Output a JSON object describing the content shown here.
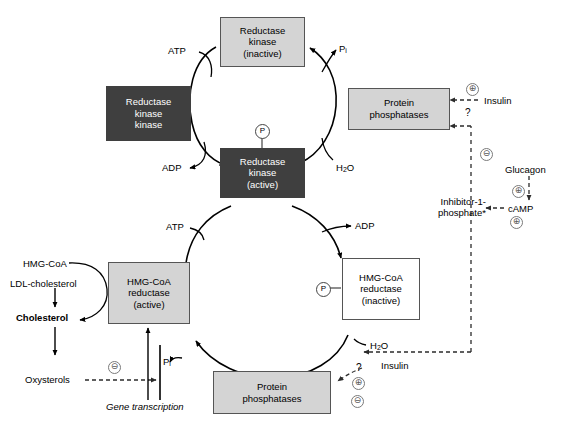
{
  "diagram": {
    "colors": {
      "box_light": "#d4d4d4",
      "box_dark": "#3f3f3f",
      "stroke": "#000000",
      "dashed": "#555555",
      "sign_circle": "#7a7a7a"
    }
  },
  "boxes": {
    "reductase_kinase_inactive": {
      "l1": "Reductase",
      "l2": "kinase",
      "l3": "(inactive)",
      "style": "light"
    },
    "reductase_kinase_kinase": {
      "l1": "Reductase",
      "l2": "kinase",
      "l3": "kinase",
      "style": "dark"
    },
    "reductase_kinase_active": {
      "l1": "Reductase",
      "l2": "kinase",
      "l3": "(active)",
      "style": "dark"
    },
    "protein_phosphatases_top": {
      "l1": "Protein",
      "l2": "phosphatases",
      "style": "light"
    },
    "hmgcoa_reductase_active": {
      "l1": "HMG-CoA",
      "l2": "reductase",
      "l3": "(active)",
      "style": "light"
    },
    "hmgcoa_reductase_inactive": {
      "l1": "HMG-CoA",
      "l2": "reductase",
      "l3": "(inactive)",
      "style": "white"
    },
    "protein_phosphatases_bottom": {
      "l1": "Protein",
      "l2": "phosphatases",
      "style": "light"
    }
  },
  "labels": {
    "atp_top": "ATP",
    "adp_top": "ADP",
    "pi_top": "P",
    "pi_top_sub": "i",
    "h2o_top": "H",
    "h2o_top_sub": "2",
    "h2o_top_tail": "O",
    "insulin_top": "Insulin",
    "question_top": "?",
    "glucagon": "Glucagon",
    "camp": "cAMP",
    "inhibitor_line1": "Inhibitor-1-",
    "inhibitor_line2": "phosphate*",
    "atp_bottom": "ATP",
    "adp_bottom": "ADP",
    "pi_bottom": "P",
    "pi_bottom_sub": "i",
    "h2o_bottom": "H",
    "h2o_bottom_sub": "2",
    "h2o_bottom_tail": "O",
    "insulin_bottom": "Insulin",
    "question_bottom": "?",
    "hmg_coa": "HMG-CoA",
    "ldl_cholesterol": "LDL-cholesterol",
    "cholesterol": "Cholesterol",
    "oxysterols": "Oxysterols",
    "gene_transcription": "Gene transcription",
    "phospho_mark": "P",
    "plus_sign": "⊕",
    "minus_sign": "⊖"
  },
  "signs": {
    "insulin_top_plus": "⊕",
    "camp_minus_to_phosphatase_top": "⊖",
    "glucagon_plus": "⊕",
    "camp_plus": "⊕",
    "insulin_bottom_plus": "⊕",
    "inhibitor_minus_bottom": "⊖",
    "oxysterols_minus": "⊖"
  }
}
